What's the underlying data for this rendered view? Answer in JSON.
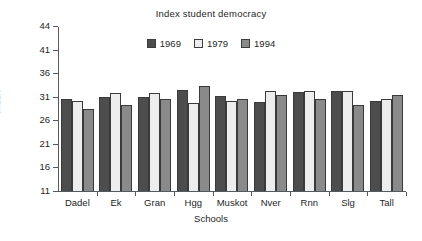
{
  "chart_data": {
    "type": "bar",
    "title": "Index student democracy",
    "xlabel": "Schools",
    "ylabel": "Index",
    "categories": [
      "Dadel",
      "Ek",
      "Gran",
      "Hgg",
      "Muskot",
      "Nver",
      "Rnn",
      "Slg",
      "Tall"
    ],
    "series": [
      {
        "name": "1969",
        "color": "#4d4d4d",
        "values": [
          30.5,
          31.0,
          30.9,
          32.5,
          31.2,
          29.8,
          32.0,
          32.2,
          30.2
        ]
      },
      {
        "name": "1979",
        "color": "#ededed",
        "values": [
          30.2,
          31.7,
          31.7,
          29.7,
          30.1,
          32.3,
          32.3,
          32.2,
          30.5
        ]
      },
      {
        "name": "1994",
        "color": "#8a8a8a",
        "values": [
          28.5,
          29.3,
          30.6,
          33.3,
          30.6,
          31.3,
          30.6,
          29.2,
          31.4
        ]
      }
    ],
    "yticks": [
      11,
      16,
      21,
      26,
      31,
      36,
      41,
      44
    ],
    "ylim": [
      11,
      44
    ],
    "grid": false,
    "legend_position": "top-center"
  }
}
